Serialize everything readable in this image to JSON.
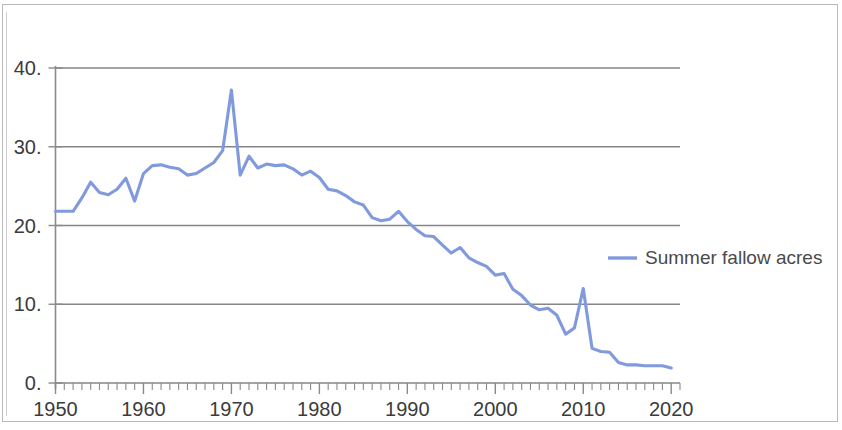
{
  "chart_data": {
    "type": "line",
    "title": "",
    "subtitle": "",
    "xlabel": "",
    "ylabel": "",
    "xlim": [
      1950,
      2021
    ],
    "ylim": [
      0,
      40
    ],
    "grid": true,
    "grid_axis": "y",
    "legend_position": "right-middle",
    "line_color": "#8199dd",
    "axis_color": "#8a8a8a",
    "grid_color": "#868686",
    "text_color": "#3b3b3b",
    "background_color": "#ffffff",
    "y_ticks": [
      0,
      10,
      20,
      30,
      40
    ],
    "y_tick_labels": [
      "0.",
      "10.",
      "20.",
      "30.",
      "40."
    ],
    "x_ticks": [
      1950,
      1960,
      1970,
      1980,
      1990,
      2000,
      2010,
      2020
    ],
    "x_tick_labels": [
      "1950",
      "1960",
      "1970",
      "1980",
      "1990",
      "2000",
      "2010",
      "2020"
    ],
    "x_minor_tick_step": 1,
    "series": [
      {
        "name": "Summer fallow acres",
        "color": "#8199dd",
        "x": [
          1950,
          1951,
          1952,
          1953,
          1954,
          1955,
          1956,
          1957,
          1958,
          1959,
          1960,
          1961,
          1962,
          1963,
          1964,
          1965,
          1966,
          1967,
          1968,
          1969,
          1970,
          1971,
          1972,
          1973,
          1974,
          1975,
          1976,
          1977,
          1978,
          1979,
          1980,
          1981,
          1982,
          1983,
          1984,
          1985,
          1986,
          1987,
          1988,
          1989,
          1990,
          1991,
          1992,
          1993,
          1994,
          1995,
          1996,
          1997,
          1998,
          1999,
          2000,
          2001,
          2002,
          2003,
          2004,
          2005,
          2006,
          2007,
          2008,
          2009,
          2010,
          2011,
          2012,
          2013,
          2014,
          2015,
          2016,
          2017,
          2018,
          2019,
          2020
        ],
        "values": [
          21.8,
          21.8,
          21.8,
          23.5,
          25.5,
          24.2,
          23.9,
          24.6,
          26.0,
          23.1,
          26.6,
          27.6,
          27.7,
          27.4,
          27.2,
          26.4,
          26.6,
          27.3,
          28.0,
          29.5,
          37.2,
          26.4,
          28.8,
          27.3,
          27.8,
          27.6,
          27.7,
          27.2,
          26.4,
          26.9,
          26.1,
          24.6,
          24.4,
          23.8,
          23.0,
          22.6,
          21.0,
          20.6,
          20.8,
          21.8,
          20.5,
          19.5,
          18.7,
          18.6,
          17.5,
          16.5,
          17.2,
          15.9,
          15.3,
          14.8,
          13.7,
          13.9,
          11.9,
          11.1,
          9.9,
          9.3,
          9.5,
          8.6,
          6.2,
          7.0,
          12.0,
          4.4,
          4.0,
          3.9,
          2.6,
          2.3,
          2.3,
          2.2,
          2.2,
          2.2,
          1.9
        ]
      }
    ]
  },
  "legend": {
    "entries": [
      {
        "label": "Summer fallow acres",
        "color": "#8199dd"
      }
    ]
  }
}
